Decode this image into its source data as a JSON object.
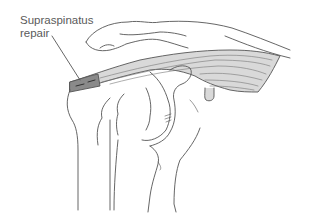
{
  "figure": {
    "labels": [
      {
        "id": "supraspinatus-repair",
        "line1": "Supraspinatus",
        "line2": "repair"
      }
    ],
    "colors": {
      "line": "#555555",
      "tendon_fill": "#d9d9d9",
      "repair_fill": "#8a8a8a",
      "label_text": "#5a5a5a",
      "background": "#ffffff"
    }
  }
}
